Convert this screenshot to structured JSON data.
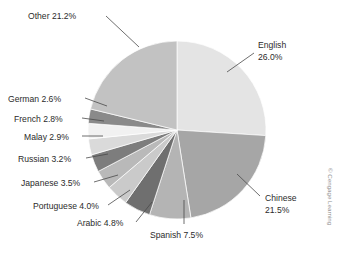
{
  "chart_data": {
    "type": "pie",
    "title": "",
    "subtitle": "",
    "xlabel": "",
    "ylabel": "",
    "grid": false,
    "legend_position": "none",
    "label_format": "{name} {value}%",
    "start_angle_deg": 0,
    "direction": "clockwise",
    "categories": [
      "English",
      "Chinese",
      "Spanish",
      "Arabic",
      "Portuguese",
      "Japanese",
      "Russian",
      "Malay",
      "French",
      "German",
      "Other"
    ],
    "values": [
      26.0,
      21.5,
      7.5,
      4.8,
      4.0,
      3.5,
      3.2,
      2.9,
      2.8,
      2.6,
      21.2
    ],
    "colors": [
      "#e4e4e4",
      "#a6a6a6",
      "#b4b4b4",
      "#6f6f6f",
      "#cacaca",
      "#b9b9b9",
      "#7d7d7d",
      "#dadada",
      "#f1f1f1",
      "#8a8a8a",
      "#c2c2c2"
    ],
    "slices": [
      {
        "name": "English",
        "value": 26.0,
        "label": "English 26.0%",
        "color": "#e4e4e4"
      },
      {
        "name": "Chinese",
        "value": 21.5,
        "label": "Chinese 21.5%",
        "color": "#a6a6a6"
      },
      {
        "name": "Spanish",
        "value": 7.5,
        "label": "Spanish 7.5%",
        "color": "#b4b4b4"
      },
      {
        "name": "Arabic",
        "value": 4.8,
        "label": "Arabic 4.8%",
        "color": "#6f6f6f"
      },
      {
        "name": "Portuguese",
        "value": 4.0,
        "label": "Portuguese 4.0%",
        "color": "#cacaca"
      },
      {
        "name": "Japanese",
        "value": 3.5,
        "label": "Japanese 3.5%",
        "color": "#b9b9b9"
      },
      {
        "name": "Russian",
        "value": 3.2,
        "label": "Russian 3.2%",
        "color": "#7d7d7d"
      },
      {
        "name": "Malay",
        "value": 2.9,
        "label": "Malay 2.9%",
        "color": "#dadada"
      },
      {
        "name": "French",
        "value": 2.8,
        "label": "French 2.8%",
        "color": "#f1f1f1"
      },
      {
        "name": "German",
        "value": 2.6,
        "label": "German 2.6%",
        "color": "#8a8a8a"
      },
      {
        "name": "Other",
        "value": 21.2,
        "label": "Other 21.2%",
        "color": "#c2c2c2"
      }
    ]
  },
  "labels": {
    "other": "Other 21.2%",
    "english_line1": "English",
    "english_line2": "26.0%",
    "chinese_line1": "Chinese",
    "chinese_line2": "21.5%",
    "spanish": "Spanish 7.5%",
    "arabic": "Arabic 4.8%",
    "portuguese": "Portuguese 4.0%",
    "japanese": "Japanese 3.5%",
    "russian": "Russian 3.2%",
    "malay": "Malay 2.9%",
    "french": "French 2.8%",
    "german": "German 2.6%"
  },
  "credit": {
    "text": "© Cengage Learning"
  },
  "style": {
    "background": "#ffffff",
    "label_color": "#2b2b2b",
    "leader_color": "#4a4a4a",
    "credit_color": "#8d8d8d"
  }
}
